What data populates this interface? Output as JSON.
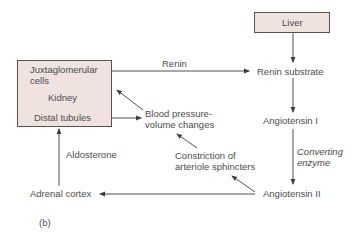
{
  "diagram": {
    "panel_label": "(b)",
    "colors": {
      "box_fill": "#efe2df",
      "box_border": "#5a5050",
      "line": "#3c3c3c",
      "text": "#4c4c4c"
    },
    "nodes": {
      "kidney": {
        "top_label_1": "Juxtaglomerular",
        "top_label_2": "cells",
        "title": "Kidney",
        "bottom_label": "Distal tubules"
      },
      "liver": {
        "title": "Liver"
      },
      "renin_substrate": "Renin substrate",
      "angiotensin_1": "Angiotensin I",
      "angiotensin_2": "Angiotensin II",
      "adrenal_cortex": "Adrenal cortex",
      "blood_pressure_1": "Blood pressure-",
      "blood_pressure_2": "volume changes",
      "constriction_1": "Constriction of",
      "constriction_2": "arteriole sphincters"
    },
    "edges": {
      "renin": "Renin",
      "converting_enzyme_1": "Converting",
      "converting_enzyme_2": "enzyme",
      "aldosterone": "Aldosterone"
    }
  }
}
